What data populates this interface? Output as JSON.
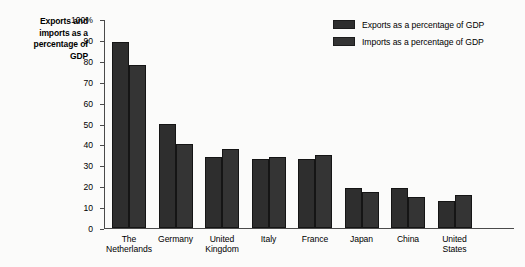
{
  "axis_title": {
    "lines": [
      "Exports and",
      "imports as a",
      "percentage of",
      "GDP"
    ]
  },
  "legend": {
    "items": [
      {
        "label": "Exports as a percentage of GDP",
        "color": "#2e2e2e"
      },
      {
        "label": "Imports as a percentage of GDP",
        "color": "#343434"
      }
    ]
  },
  "y_axis": {
    "ticks": [
      {
        "label": "100%",
        "value": 100
      },
      {
        "label": "90",
        "value": 90
      },
      {
        "label": "80",
        "value": 80
      },
      {
        "label": "70",
        "value": 70
      },
      {
        "label": "60",
        "value": 60
      },
      {
        "label": "50",
        "value": 50
      },
      {
        "label": "40",
        "value": 40
      },
      {
        "label": "30",
        "value": 30
      },
      {
        "label": "20",
        "value": 20
      },
      {
        "label": "10",
        "value": 10
      },
      {
        "label": "0",
        "value": 0
      }
    ]
  },
  "categories_display": [
    [
      "The",
      "Netherlands"
    ],
    [
      "Germany",
      ""
    ],
    [
      "United",
      "Kingdom"
    ],
    [
      "Italy",
      ""
    ],
    [
      "France",
      ""
    ],
    [
      "Japan",
      ""
    ],
    [
      "China",
      ""
    ],
    [
      "United",
      "States"
    ]
  ],
  "chart_data": {
    "type": "bar",
    "title": "",
    "xlabel": "",
    "ylabel": "Exports and imports as a percentage of GDP",
    "ylim": [
      0,
      100
    ],
    "ytick_interval": 10,
    "grid": false,
    "legend_position": "top-right",
    "categories": [
      "The Netherlands",
      "Germany",
      "United Kingdom",
      "Italy",
      "France",
      "Japan",
      "China",
      "United States"
    ],
    "series": [
      {
        "name": "Exports as a percentage of GDP",
        "values": [
          89,
          50,
          34,
          33,
          33,
          19,
          19,
          13
        ]
      },
      {
        "name": "Imports as a percentage of GDP",
        "values": [
          78,
          40,
          38,
          34,
          35,
          17,
          15,
          16
        ]
      }
    ]
  }
}
